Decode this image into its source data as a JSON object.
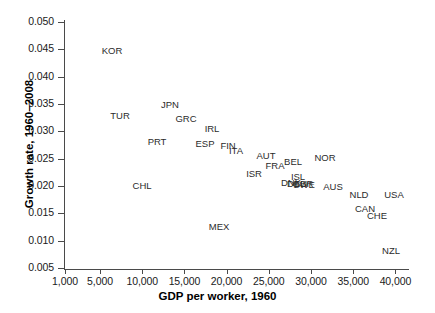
{
  "chart_data": {
    "type": "scatter",
    "title": "",
    "xlabel": "GDP per worker, 1960",
    "ylabel": "Growth rate, 1960–2008",
    "xlim": [
      1000,
      40000
    ],
    "ylim": [
      0.005,
      0.05
    ],
    "grid": false,
    "legend": "none",
    "marker_style": "text-label-only",
    "xticks": [
      1000,
      5000,
      10000,
      15000,
      20000,
      25000,
      30000,
      35000,
      40000
    ],
    "xtick_labels": [
      "1,000",
      "5,000",
      "10,000",
      "15,000",
      "20,000",
      "25,000",
      "30,000",
      "35,000",
      "40,000"
    ],
    "yticks": [
      0.005,
      0.01,
      0.015,
      0.02,
      0.025,
      0.03,
      0.035,
      0.04,
      0.045,
      0.05
    ],
    "ytick_labels": [
      "0.005",
      "0.010",
      "0.015",
      "0.020",
      "0.025",
      "0.030",
      "0.035",
      "0.040",
      "0.045",
      "0.050"
    ],
    "points": [
      {
        "label": "KOR",
        "x": 5800,
        "y": 0.0445,
        "px": 112,
        "py": 50
      },
      {
        "label": "TUR",
        "x": 7300,
        "y": 0.0325,
        "px": 120,
        "py": 115
      },
      {
        "label": "JPN",
        "x": 11900,
        "y": 0.0337,
        "px": 170,
        "py": 104
      },
      {
        "label": "GRC",
        "x": 13700,
        "y": 0.0311,
        "px": 186,
        "py": 118
      },
      {
        "label": "PRT",
        "x": 10800,
        "y": 0.027,
        "px": 157,
        "py": 141
      },
      {
        "label": "IRL",
        "x": 15600,
        "y": 0.0292,
        "px": 212,
        "py": 128
      },
      {
        "label": "ESP",
        "x": 15200,
        "y": 0.0266,
        "px": 205,
        "py": 143
      },
      {
        "label": "FIN",
        "x": 17700,
        "y": 0.0262,
        "px": 228,
        "py": 145
      },
      {
        "label": "ITA",
        "x": 18500,
        "y": 0.0253,
        "px": 236,
        "py": 150
      },
      {
        "label": "AUT",
        "x": 21500,
        "y": 0.0243,
        "px": 266,
        "py": 155
      },
      {
        "label": "BEL",
        "x": 24300,
        "y": 0.0232,
        "px": 293,
        "py": 161
      },
      {
        "label": "FRA",
        "x": 22400,
        "y": 0.0226,
        "px": 275,
        "py": 165
      },
      {
        "label": "ISR",
        "x": 20200,
        "y": 0.0212,
        "px": 254,
        "py": 173
      },
      {
        "label": "NOR",
        "x": 28700,
        "y": 0.0228,
        "px": 325,
        "py": 157
      },
      {
        "label": "ISL",
        "x": 26200,
        "y": 0.0198,
        "px": 298,
        "py": 176
      },
      {
        "label": "DNK",
        "x": 25700,
        "y": 0.0193,
        "px": 291,
        "py": 182
      },
      {
        "label": "DEU",
        "x": 26200,
        "y": 0.0192,
        "px": 297,
        "py": 183
      },
      {
        "label": "GBR",
        "x": 26900,
        "y": 0.0191,
        "px": 303,
        "py": 183
      },
      {
        "label": "SWE",
        "x": 27000,
        "y": 0.019,
        "px": 304,
        "py": 184
      },
      {
        "label": "AUS",
        "x": 29700,
        "y": 0.0186,
        "px": 333,
        "py": 186
      },
      {
        "label": "NLD",
        "x": 32600,
        "y": 0.0181,
        "px": 359,
        "py": 194
      },
      {
        "label": "USA",
        "x": 35800,
        "y": 0.018,
        "px": 394,
        "py": 194
      },
      {
        "label": "CAN",
        "x": 33200,
        "y": 0.0166,
        "px": 365,
        "py": 208
      },
      {
        "label": "CHE",
        "x": 34600,
        "y": 0.0157,
        "px": 377,
        "py": 215
      },
      {
        "label": "CHL",
        "x": 9800,
        "y": 0.019,
        "px": 142,
        "py": 185
      },
      {
        "label": "MEX",
        "x": 14800,
        "y": 0.0108,
        "px": 219,
        "py": 226
      },
      {
        "label": "NZL",
        "x": 37000,
        "y": 0.0073,
        "px": 391,
        "py": 250
      }
    ]
  }
}
